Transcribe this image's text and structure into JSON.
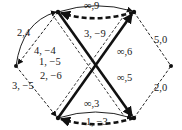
{
  "diagram": {
    "type": "flow-network",
    "nodes": [
      {
        "id": "s",
        "x": 16,
        "y": 66
      },
      {
        "id": "a",
        "x": 58,
        "y": 12
      },
      {
        "id": "b",
        "x": 134,
        "y": 12
      },
      {
        "id": "c",
        "x": 58,
        "y": 118
      },
      {
        "id": "d",
        "x": 134,
        "y": 118
      },
      {
        "id": "t",
        "x": 171,
        "y": 66
      }
    ],
    "edges": [
      {
        "from": "s",
        "to": "a",
        "label": "2,4",
        "style": "solid-arc"
      },
      {
        "from": "a",
        "to": "s",
        "label": "4, −4",
        "style": "dashed"
      },
      {
        "from": "a",
        "to": "b",
        "label": "∞,9",
        "style": "solid-arc"
      },
      {
        "from": "b",
        "to": "a",
        "label": "3, −9",
        "style": "bold-dashed"
      },
      {
        "from": "a",
        "to": "d",
        "label": "1, −5",
        "style": "dashed"
      },
      {
        "from": "a",
        "to": "d",
        "label": "∞,5",
        "style": "bold"
      },
      {
        "from": "c",
        "to": "b",
        "label": "∞,6",
        "style": "bold"
      },
      {
        "from": "b",
        "to": "c",
        "label": "2, −6",
        "style": "dashed"
      },
      {
        "from": "s",
        "to": "c",
        "label": "3, −5",
        "style": "dashed"
      },
      {
        "from": "c",
        "to": "d",
        "label": "∞,3",
        "style": "solid-arc"
      },
      {
        "from": "d",
        "to": "c",
        "label": "1, −3",
        "style": "bold-dashed"
      },
      {
        "from": "b",
        "to": "t",
        "label": "5,0",
        "style": "dashed"
      },
      {
        "from": "d",
        "to": "t",
        "label": "2,0",
        "style": "dashed"
      }
    ]
  }
}
